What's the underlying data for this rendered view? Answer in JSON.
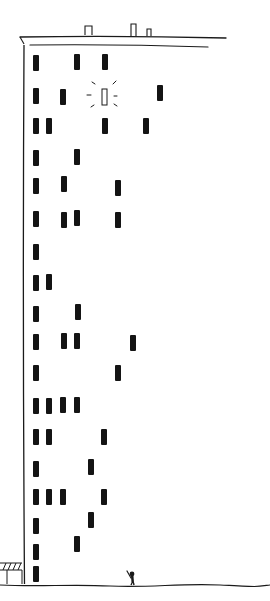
{
  "scene": {
    "description": "Hand-drawn tall apartment building with dark windows, one lit window, rooftop chimneys, a shop awning and a small waving figure on the ground",
    "colors": {
      "background": "#ffffff",
      "ink": "#1a1a1a",
      "window": "#141414"
    }
  },
  "building": {
    "roof": {
      "outer_line": {
        "x1": 20,
        "y1": 37,
        "x2": 226,
        "y2": 38
      },
      "inner_line": {
        "x1": 30,
        "y1": 45,
        "x2": 208,
        "y2": 47
      },
      "chimneys": [
        {
          "x": 85,
          "y": 26,
          "w": 7,
          "h": 9
        },
        {
          "x": 131,
          "y": 24,
          "w": 5,
          "h": 12
        },
        {
          "x": 147,
          "y": 29,
          "w": 4,
          "h": 7
        }
      ]
    },
    "left_wall": {
      "x": 24,
      "y_top": 45,
      "y_bottom": 584
    },
    "window_size": {
      "w": 6,
      "h": 16
    },
    "windows": [
      {
        "x": 33,
        "y": 55
      },
      {
        "x": 74,
        "y": 54
      },
      {
        "x": 102,
        "y": 54
      },
      {
        "x": 33,
        "y": 88
      },
      {
        "x": 60,
        "y": 89
      },
      {
        "x": 157,
        "y": 85
      },
      {
        "x": 33,
        "y": 118
      },
      {
        "x": 46,
        "y": 118
      },
      {
        "x": 102,
        "y": 118
      },
      {
        "x": 143,
        "y": 118
      },
      {
        "x": 33,
        "y": 150
      },
      {
        "x": 74,
        "y": 149
      },
      {
        "x": 33,
        "y": 178
      },
      {
        "x": 61,
        "y": 176
      },
      {
        "x": 115,
        "y": 180
      },
      {
        "x": 33,
        "y": 211
      },
      {
        "x": 61,
        "y": 212
      },
      {
        "x": 74,
        "y": 210
      },
      {
        "x": 115,
        "y": 212
      },
      {
        "x": 33,
        "y": 244
      },
      {
        "x": 33,
        "y": 275
      },
      {
        "x": 46,
        "y": 274
      },
      {
        "x": 33,
        "y": 306
      },
      {
        "x": 75,
        "y": 304
      },
      {
        "x": 33,
        "y": 334
      },
      {
        "x": 61,
        "y": 333
      },
      {
        "x": 74,
        "y": 333
      },
      {
        "x": 130,
        "y": 335
      },
      {
        "x": 33,
        "y": 365
      },
      {
        "x": 115,
        "y": 365
      },
      {
        "x": 33,
        "y": 398
      },
      {
        "x": 46,
        "y": 398
      },
      {
        "x": 60,
        "y": 397
      },
      {
        "x": 74,
        "y": 397
      },
      {
        "x": 33,
        "y": 429
      },
      {
        "x": 46,
        "y": 429
      },
      {
        "x": 101,
        "y": 429
      },
      {
        "x": 33,
        "y": 461
      },
      {
        "x": 88,
        "y": 459
      },
      {
        "x": 33,
        "y": 489
      },
      {
        "x": 46,
        "y": 489
      },
      {
        "x": 60,
        "y": 489
      },
      {
        "x": 101,
        "y": 489
      },
      {
        "x": 33,
        "y": 518
      },
      {
        "x": 88,
        "y": 512
      },
      {
        "x": 33,
        "y": 544
      },
      {
        "x": 74,
        "y": 536
      },
      {
        "x": 33,
        "y": 566
      }
    ],
    "lit_window": {
      "x": 102,
      "y": 89,
      "w": 5,
      "h": 16,
      "rays": [
        {
          "x1": 92,
          "y1": 82,
          "x2": 95,
          "y2": 84
        },
        {
          "x1": 116,
          "y1": 81,
          "x2": 113,
          "y2": 84
        },
        {
          "x1": 87,
          "y1": 95,
          "x2": 91,
          "y2": 95
        },
        {
          "x1": 114,
          "y1": 96,
          "x2": 117,
          "y2": 96
        },
        {
          "x1": 91,
          "y1": 107,
          "x2": 94,
          "y2": 105
        },
        {
          "x1": 114,
          "y1": 104,
          "x2": 117,
          "y2": 106
        }
      ]
    }
  },
  "awning": {
    "x": 0,
    "y": 563,
    "w": 22,
    "h": 7,
    "stripes": 4,
    "post_x": 7,
    "post_bottom": 584
  },
  "figure": {
    "x": 131,
    "y_head": 572,
    "waving": true
  },
  "ground": {
    "y": 585
  }
}
